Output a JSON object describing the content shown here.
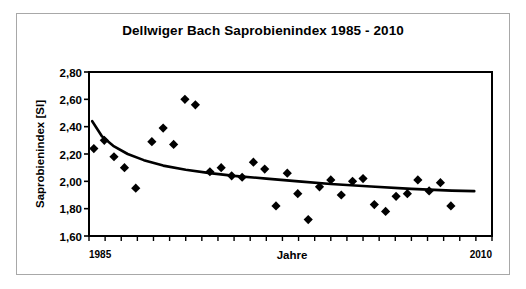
{
  "chart_data": {
    "type": "scatter",
    "title": "Dellwiger Bach Saprobienindex 1985 - 2010",
    "xlabel": "Jahre",
    "ylabel": "Saprobienindex [SI]",
    "xlim": [
      1985,
      2010
    ],
    "ylim": [
      1.6,
      2.8
    ],
    "x_tick_labels": [
      "1985",
      "2010"
    ],
    "y_tick_labels": [
      "1,60",
      "1,80",
      "2,00",
      "2,20",
      "2,40",
      "2,60",
      "2,80"
    ],
    "y_ticks": [
      1.6,
      1.8,
      2.0,
      2.2,
      2.4,
      2.6,
      2.8
    ],
    "grid": false,
    "legend": "none",
    "marker": "filled-diamond",
    "marker_color": "#000000",
    "x": [
      1985.3,
      1985.95,
      1986.55,
      1987.2,
      1987.9,
      1988.9,
      1989.6,
      1990.25,
      1990.95,
      1991.6,
      1992.5,
      1993.2,
      1993.85,
      1994.5,
      1995.2,
      1995.9,
      1996.6,
      1997.3,
      1997.95,
      1998.6,
      1999.3,
      2000.0,
      2000.65,
      2001.35,
      2002.0,
      2002.7,
      2003.4,
      2004.05,
      2004.75,
      2005.4,
      2006.1,
      2006.8,
      2007.45,
      2008.15,
      2008.8
    ],
    "y": [
      2.24,
      2.3,
      2.18,
      2.1,
      1.95,
      2.29,
      2.39,
      2.27,
      2.6,
      2.56,
      2.07,
      2.1,
      2.04,
      2.03,
      2.14,
      2.09,
      1.82,
      2.06,
      1.91,
      1.72,
      1.96,
      2.01,
      1.9,
      2.0,
      2.02,
      1.83,
      1.78,
      1.89,
      1.91,
      2.01,
      1.93,
      1.99,
      1.82
    ],
    "points": [
      {
        "x": 1985.3,
        "y": 2.24
      },
      {
        "x": 1985.95,
        "y": 2.3
      },
      {
        "x": 1986.55,
        "y": 2.18
      },
      {
        "x": 1987.2,
        "y": 2.1
      },
      {
        "x": 1987.9,
        "y": 1.95
      },
      {
        "x": 1988.9,
        "y": 2.29
      },
      {
        "x": 1989.6,
        "y": 2.39
      },
      {
        "x": 1990.25,
        "y": 2.27
      },
      {
        "x": 1990.95,
        "y": 2.6
      },
      {
        "x": 1991.6,
        "y": 2.56
      },
      {
        "x": 1992.5,
        "y": 2.07
      },
      {
        "x": 1993.2,
        "y": 2.1
      },
      {
        "x": 1993.85,
        "y": 2.04
      },
      {
        "x": 1994.5,
        "y": 2.03
      },
      {
        "x": 1995.2,
        "y": 2.14
      },
      {
        "x": 1995.9,
        "y": 2.09
      },
      {
        "x": 1996.6,
        "y": 1.82
      },
      {
        "x": 1997.3,
        "y": 2.06
      },
      {
        "x": 1997.95,
        "y": 1.91
      },
      {
        "x": 1998.6,
        "y": 1.72
      },
      {
        "x": 1999.3,
        "y": 1.96
      },
      {
        "x": 2000.0,
        "y": 2.01
      },
      {
        "x": 2000.65,
        "y": 1.9
      },
      {
        "x": 2001.35,
        "y": 2.0
      },
      {
        "x": 2002.0,
        "y": 2.02
      },
      {
        "x": 2002.7,
        "y": 1.83
      },
      {
        "x": 2003.4,
        "y": 1.78
      },
      {
        "x": 2004.05,
        "y": 1.89
      },
      {
        "x": 2004.75,
        "y": 1.91
      },
      {
        "x": 2005.4,
        "y": 2.01
      },
      {
        "x": 2006.1,
        "y": 1.93
      },
      {
        "x": 2006.8,
        "y": 1.99
      },
      {
        "x": 2007.45,
        "y": 1.82
      }
    ],
    "trendline": {
      "type": "logarithmic",
      "color": "#000000",
      "points": [
        {
          "x": 1985.2,
          "y": 2.44
        },
        {
          "x": 1985.8,
          "y": 2.33
        },
        {
          "x": 1986.5,
          "y": 2.26
        },
        {
          "x": 1987.4,
          "y": 2.2
        },
        {
          "x": 1988.4,
          "y": 2.155
        },
        {
          "x": 1989.6,
          "y": 2.115
        },
        {
          "x": 1991.0,
          "y": 2.085
        },
        {
          "x": 1992.5,
          "y": 2.06
        },
        {
          "x": 1994.0,
          "y": 2.04
        },
        {
          "x": 1996.0,
          "y": 2.02
        },
        {
          "x": 1998.0,
          "y": 2.0
        },
        {
          "x": 2000.0,
          "y": 1.98
        },
        {
          "x": 2002.5,
          "y": 1.962
        },
        {
          "x": 2005.0,
          "y": 1.945
        },
        {
          "x": 2007.5,
          "y": 1.932
        },
        {
          "x": 2008.9,
          "y": 1.928
        }
      ]
    }
  }
}
